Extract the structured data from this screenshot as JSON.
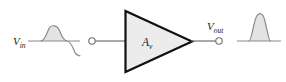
{
  "figure": {
    "type": "amplifier-block-diagram",
    "background_color": "#ffffff",
    "stroke_color": "#6f6f6f",
    "dark_stroke_color": "#1a1a1a",
    "fill_color": "#e3e3e3",
    "triangle_fill_color": "#ececec"
  },
  "labels": {
    "input_voltage": {
      "symbol": "V",
      "subscript": "in",
      "full": "Vin"
    },
    "output_voltage": {
      "symbol": "V",
      "subscript": "out",
      "full": "Vout"
    },
    "gain": {
      "symbol": "A",
      "subscript": "v",
      "full": "Av"
    }
  },
  "input_waveform": {
    "name": "input-sine-wave",
    "shape": "full-sine-cycle",
    "cycles": 1,
    "shaded_half": "positive",
    "baseline_x_start": 28,
    "baseline_x_end": 80,
    "baseline_y": 41,
    "amplitude_px": 15,
    "stroke_color": "#8a8a8a",
    "fill_color": "#e3e3e3"
  },
  "output_waveform": {
    "name": "output-half-cycle",
    "shape": "single-positive-arch",
    "cycles": 0.5,
    "shaded_half": "positive",
    "baseline_x_start": 237,
    "baseline_x_end": 281,
    "baseline_y": 41,
    "amplitude_px": 28,
    "stroke_color": "#8a8a8a",
    "fill_color": "#e3e3e3"
  },
  "amplifier": {
    "name": "amplifier-triangle",
    "left_x": 125,
    "apex_x": 192,
    "top_y": 11,
    "bottom_y": 72,
    "center_y": 41,
    "fill_color": "#ececec",
    "stroke_color": "#111111",
    "stroke_width": 2.2
  },
  "terminals": [
    {
      "name": "input-terminal",
      "cx": 92,
      "cy": 41,
      "r": 3.2,
      "style": "open-circle"
    },
    {
      "name": "output-terminal",
      "cx": 219,
      "cy": 41,
      "r": 3.2,
      "style": "open-circle"
    }
  ],
  "wires": [
    {
      "name": "input-wire",
      "x1": 95,
      "y1": 41,
      "x2": 125,
      "y2": 41
    },
    {
      "name": "output-wire",
      "x1": 192,
      "y1": 41,
      "x2": 216,
      "y2": 41
    }
  ]
}
